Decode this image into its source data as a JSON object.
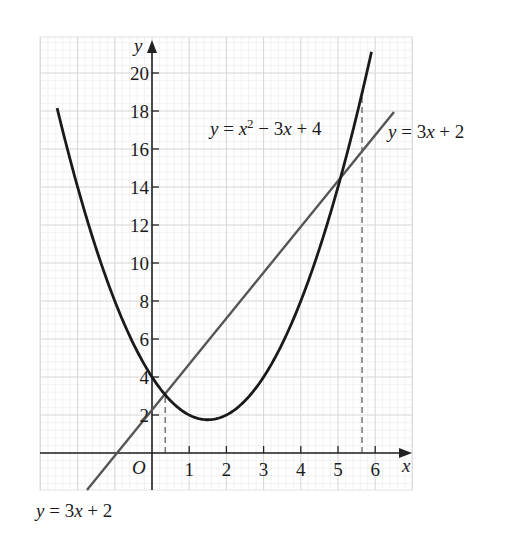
{
  "chart_data": {
    "type": "line",
    "title": "",
    "xlabel": "x",
    "ylabel": "y",
    "origin_label": "O",
    "xlim": [
      -3,
      7
    ],
    "ylim": [
      -2,
      22
    ],
    "grid": true,
    "x_ticks": [
      1,
      2,
      3,
      4,
      5,
      6
    ],
    "y_ticks": [
      2,
      4,
      6,
      8,
      10,
      12,
      14,
      16,
      18,
      20
    ],
    "series": [
      {
        "name": "y = x² − 3x + 4",
        "equation": "x^2 - 3x + 4",
        "color": "#1a1a1a",
        "x_range": [
          -2.55,
          5.9
        ],
        "points": [
          [
            -2.5,
            17.75
          ],
          [
            -2,
            14
          ],
          [
            -1,
            8
          ],
          [
            0,
            4
          ],
          [
            0.354,
            3.06
          ],
          [
            1,
            2
          ],
          [
            1.5,
            1.75
          ],
          [
            2,
            2
          ],
          [
            3,
            4
          ],
          [
            4,
            8
          ],
          [
            5,
            14
          ],
          [
            5.646,
            18.94
          ]
        ]
      },
      {
        "name": "y = 3x + 2",
        "equation": "3x + 2",
        "color": "#555555",
        "x_range": [
          -1.75,
          6.5
        ],
        "points": [
          [
            -0.667,
            0
          ],
          [
            0,
            2
          ],
          [
            0.354,
            3.06
          ],
          [
            5.646,
            18.94
          ],
          [
            6,
            20
          ]
        ]
      }
    ],
    "intersections": [
      {
        "x": 0.354,
        "y": 3.06
      },
      {
        "x": 5.646,
        "y": 18.94
      }
    ],
    "annotations": [
      {
        "text_parts": [
          "y",
          " = ",
          "x",
          "2",
          " − 3",
          "x",
          " + 4"
        ],
        "position": "upper-middle",
        "refers_to": "parabola"
      },
      {
        "text_parts": [
          "y",
          " = 3",
          "x",
          " + 2"
        ],
        "position": "upper-right",
        "refers_to": "line"
      },
      {
        "text_parts": [
          "y",
          " = 3",
          "x",
          " + 2"
        ],
        "position": "bottom-left",
        "refers_to": "line"
      }
    ],
    "dashed_guides": [
      0.354,
      5.646
    ]
  },
  "labels": {
    "x_axis": "x",
    "y_axis": "y",
    "origin": "O",
    "parabola": {
      "y": "y",
      "eq": " = ",
      "x": "x",
      "sup": "2",
      "rest1": " − 3",
      "x2": "x",
      "rest2": " + 4"
    },
    "line_top": {
      "y": "y",
      "eq": " = 3",
      "x": "x",
      "rest": " + 2"
    },
    "line_bottom": {
      "y": "y",
      "eq": " = 3",
      "x": "x",
      "rest": " + 2"
    },
    "x_ticks": [
      "1",
      "2",
      "3",
      "4",
      "5",
      "6"
    ],
    "y_ticks": [
      "2",
      "4",
      "6",
      "8",
      "10",
      "12",
      "14",
      "16",
      "18",
      "20"
    ]
  }
}
